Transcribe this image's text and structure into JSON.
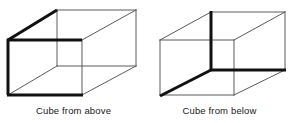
{
  "figure": {
    "background_color": "#ffffff",
    "thin_line_color": "#5a5a5f",
    "bold_line_color": "#111113",
    "thin_stroke_width": 1,
    "bold_stroke_width": 3,
    "width": 293,
    "height": 123
  },
  "panels": [
    {
      "id": "cube-from-above",
      "caption": "Cube from above",
      "emphasis": "top-left-front-face",
      "vertices": {
        "front_top_left": [
          8,
          40
        ],
        "front_top_right": [
          82,
          40
        ],
        "front_bottom_left": [
          8,
          95
        ],
        "front_bottom_right": [
          82,
          95
        ],
        "back_top_left": [
          57,
          10
        ],
        "back_top_right": [
          136,
          10
        ],
        "back_bottom_left": [
          57,
          66
        ],
        "back_bottom_right": [
          136,
          66
        ]
      },
      "bold_edges": [
        [
          "back_top_left",
          "front_top_left"
        ],
        [
          "front_top_left",
          "front_top_right"
        ],
        [
          "front_top_left",
          "front_bottom_left"
        ],
        [
          "front_bottom_left",
          "front_bottom_right"
        ]
      ]
    },
    {
      "id": "cube-from-below",
      "caption": "Cube from below",
      "emphasis": "bottom-right-back-face",
      "vertices": {
        "front_top_left": [
          160,
          40
        ],
        "front_top_right": [
          234,
          40
        ],
        "front_bottom_left": [
          160,
          95
        ],
        "front_bottom_right": [
          234,
          95
        ],
        "back_top_left": [
          211,
          12
        ],
        "back_top_right": [
          285,
          12
        ],
        "back_bottom_left": [
          211,
          70
        ],
        "back_bottom_right": [
          285,
          70
        ]
      },
      "bold_edges": [
        [
          "back_top_left",
          "back_bottom_left"
        ],
        [
          "back_bottom_left",
          "back_bottom_right"
        ],
        [
          "back_bottom_left",
          "front_bottom_left"
        ]
      ]
    }
  ]
}
